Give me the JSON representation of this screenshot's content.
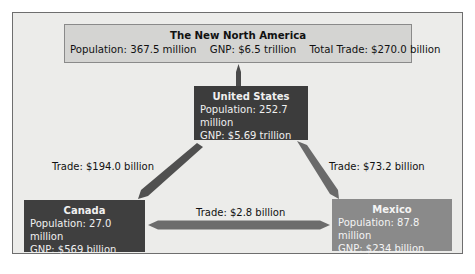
{
  "title_box": {
    "title": "The New North America",
    "population": "Population: 367.5 million",
    "gnp": "GNP: $6.5 trillion",
    "total_trade": "Total Trade: $270.0 billion"
  },
  "nodes": {
    "us": {
      "name": "United States",
      "population": "Population: 252.7 million",
      "gnp": "GNP: $5.69 trillion"
    },
    "canada": {
      "name": "Canada",
      "population": "Population: 27.0 million",
      "gnp": "GNP: $569 billion"
    },
    "mexico": {
      "name": "Mexico",
      "population": "Population: 87.8 million",
      "gnp": "GNP: $234 billion"
    }
  },
  "edges": {
    "us_canada": "Trade: $194.0 billion",
    "us_mexico": "Trade: $73.2 billion",
    "canada_mexico": "Trade: $2.8 billion"
  },
  "colors": {
    "us_box": "#3c3c3c",
    "canada_box": "#3f3f3f",
    "mexico_box": "#8a8a8a",
    "title_box": "#d4d4d2",
    "arrow": "#555555"
  }
}
